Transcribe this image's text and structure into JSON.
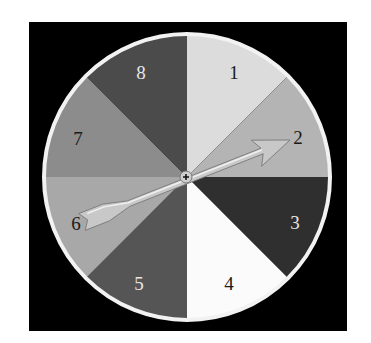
{
  "spinner": {
    "background_color": "#000000",
    "rim_color": "#f2f2f2",
    "center": {
      "x": 187,
      "y": 177
    },
    "radius": 142,
    "sectors": [
      {
        "label": "1",
        "color": "#dcdcdc",
        "text_color": "#1a1a1a",
        "lx": 234,
        "ly": 79
      },
      {
        "label": "2",
        "color": "#b4b4b4",
        "text_color": "#1a1a1a",
        "lx": 298,
        "ly": 144
      },
      {
        "label": "3",
        "color": "#2f2f2f",
        "text_color": "#e6e6e6",
        "lx": 295,
        "ly": 229
      },
      {
        "label": "4",
        "color": "#fbfbfb",
        "text_color": "#1a1a1a",
        "lx": 229,
        "ly": 290
      },
      {
        "label": "5",
        "color": "#555555",
        "text_color": "#e6e6e6",
        "lx": 139,
        "ly": 290
      },
      {
        "label": "6",
        "color": "#a8a8a8",
        "text_color": "#1a1a1a",
        "lx": 76,
        "ly": 230
      },
      {
        "label": "7",
        "color": "#8c8c8c",
        "text_color": "#1a1a1a",
        "lx": 78,
        "ly": 145
      },
      {
        "label": "8",
        "color": "#4b4b4b",
        "text_color": "#e6e6e6",
        "lx": 141,
        "ly": 79
      }
    ],
    "pointer": {
      "points_to": "2",
      "tip": {
        "x": 290,
        "y": 140
      },
      "tail": {
        "x": 82,
        "y": 222
      },
      "color": "#c8c8c8"
    }
  }
}
